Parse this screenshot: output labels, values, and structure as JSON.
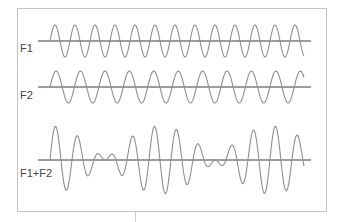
{
  "chart_data": {
    "type": "line",
    "title": "",
    "x_domain": [
      0,
      1
    ],
    "series": [
      {
        "name": "F1",
        "label": "F1",
        "cycles": 12.7,
        "amplitude": 1.0,
        "phase": 0
      },
      {
        "name": "F2",
        "label": "F2",
        "cycles": 10.4,
        "amplitude": 1.0,
        "phase": 0
      },
      {
        "name": "F1+F2",
        "label": "F1+F2",
        "components": [
          "F1",
          "F2"
        ],
        "amplitude": 2.0
      }
    ],
    "grid": false,
    "legend": "none"
  },
  "colors": {
    "wave": "#8f8f8f",
    "axis": "#3a3a3a",
    "frame": "#c4c4c4",
    "label": "#444444"
  }
}
